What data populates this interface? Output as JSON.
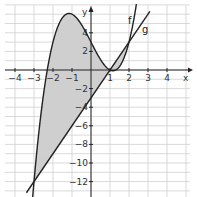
{
  "chart_data": {
    "type": "line",
    "title": "",
    "xlabel": "x",
    "ylabel": "y",
    "xlim": [
      -4.7,
      5.5
    ],
    "ylim": [
      -13.6,
      6.8
    ],
    "grid": true,
    "x_ticks": [
      "-4",
      "-3",
      "-2",
      "-1",
      "1",
      "2",
      "3",
      "4"
    ],
    "y_ticks": [
      "4",
      "2",
      "-2",
      "-4",
      "-6",
      "-8",
      "-10",
      "-12"
    ],
    "series": [
      {
        "name": "f",
        "expression": "x^3 - 4x + 3",
        "color": "#222222"
      },
      {
        "name": "g",
        "expression": "3x - 3",
        "color": "#222222"
      }
    ],
    "shaded_region": {
      "between": [
        "f",
        "g"
      ],
      "x_range": [
        -3,
        2
      ],
      "color": "#cfcfcf"
    },
    "intersections": [
      [
        -3,
        -12
      ],
      [
        1,
        0
      ],
      [
        2,
        3
      ]
    ]
  },
  "labels": {
    "x_axis": "x",
    "y_axis": "y",
    "f": "f",
    "g": "g"
  }
}
